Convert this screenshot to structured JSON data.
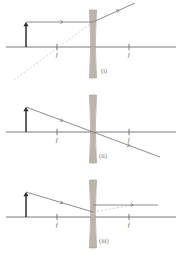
{
  "figure": {
    "width": 182,
    "height": 255,
    "background_color": "#ffffff",
    "colors": {
      "axis": "#6e6b66",
      "ray": "#7c7975",
      "object_arrow": "#2f2d2b",
      "lens_fill": "#b8b2a6",
      "lens_stroke": "#a39c8e",
      "virtual_ray": "#cfc9bf",
      "label": "#6d6a66"
    },
    "panels": [
      {
        "id": "panel-i",
        "label": "(i)",
        "label_x": 101,
        "label_y": 73,
        "axis": {
          "y": 47,
          "x1": 6,
          "x2": 176
        },
        "lens": {
          "x": 93,
          "top": 10,
          "bottom": 78,
          "half_width_edge": 3.6,
          "waist_half_width": 1.0
        },
        "focal_points": [
          {
            "label": "f",
            "x": 57,
            "side": "left"
          },
          {
            "label": "f",
            "x": 129,
            "side": "right"
          }
        ],
        "object": {
          "x": 26,
          "base_y": 47,
          "tip_y": 22,
          "label": ""
        },
        "rays": [
          {
            "name": "incident-parallel-ray",
            "kind": "solid",
            "x1": 26,
            "y1": 22,
            "x2": 93,
            "y2": 22,
            "arrow_at": 0.55
          },
          {
            "name": "refracted-diverging-ray",
            "kind": "solid",
            "x1": 93,
            "y1": 22,
            "x2": 135,
            "y2": 3,
            "arrow_at": 0.62
          },
          {
            "name": "virtual-ray-extension",
            "kind": "faint",
            "x1": 93,
            "y1": 22,
            "x2": 14,
            "y2": 80,
            "arrow_at": -1
          }
        ]
      },
      {
        "id": "panel-ii",
        "label": "(ii)",
        "label_x": 99,
        "label_y": 158,
        "axis": {
          "y": 132,
          "x1": 6,
          "x2": 176
        },
        "lens": {
          "x": 93,
          "top": 95,
          "bottom": 163,
          "half_width_edge": 3.6,
          "waist_half_width": 1.0
        },
        "focal_points": [
          {
            "label": "f",
            "x": 57,
            "side": "left"
          },
          {
            "label": "f",
            "x": 129,
            "side": "right"
          }
        ],
        "object": {
          "x": 26,
          "base_y": 132,
          "tip_y": 107,
          "label": ""
        },
        "rays": [
          {
            "name": "chief-ray-through-center",
            "kind": "solid",
            "x1": 26,
            "y1": 107,
            "x2": 93,
            "y2": 132,
            "arrow_at": 0.55
          },
          {
            "name": "chief-ray-continued",
            "kind": "solid",
            "x1": 93,
            "y1": 132,
            "x2": 160,
            "y2": 157,
            "arrow_at": 0.55
          }
        ]
      },
      {
        "id": "panel-iii",
        "label": "(iii)",
        "label_x": 99,
        "label_y": 243,
        "axis": {
          "y": 217,
          "x1": 6,
          "x2": 176
        },
        "lens": {
          "x": 93,
          "top": 180,
          "bottom": 248,
          "half_width_edge": 3.6,
          "waist_half_width": 1.0
        },
        "focal_points": [
          {
            "label": "f",
            "x": 57,
            "side": "left"
          },
          {
            "label": "f",
            "x": 129,
            "side": "right"
          }
        ],
        "object": {
          "x": 26,
          "base_y": 217,
          "tip_y": 192,
          "label": ""
        },
        "rays": [
          {
            "name": "incident-ray-toward-far-focus",
            "kind": "solid",
            "x1": 26,
            "y1": 192,
            "x2": 93,
            "y2": 212,
            "arrow_at": 0.55
          },
          {
            "name": "refracted-parallel-ray",
            "kind": "solid",
            "x1": 93,
            "y1": 205,
            "x2": 158,
            "y2": 205,
            "arrow_at": 0.62
          },
          {
            "name": "virtual-ray-extension",
            "kind": "faint",
            "x1": 93,
            "y1": 212,
            "x2": 133,
            "y2": 205,
            "arrow_at": -1
          }
        ]
      }
    ]
  }
}
